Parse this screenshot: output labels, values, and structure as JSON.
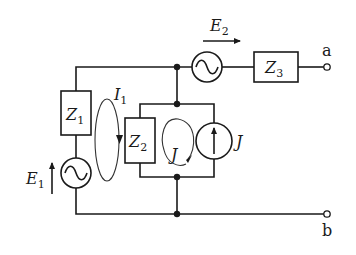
{
  "diagram": {
    "type": "electrical-circuit",
    "components": {
      "Z1": {
        "label": "Z",
        "sub": "1",
        "kind": "impedance"
      },
      "Z2": {
        "label": "Z",
        "sub": "2",
        "kind": "impedance"
      },
      "Z3": {
        "label": "Z",
        "sub": "3",
        "kind": "impedance"
      },
      "E1": {
        "label": "E",
        "sub": "1",
        "kind": "ac-voltage-source",
        "arrow": "up"
      },
      "E2": {
        "label": "E",
        "sub": "2",
        "kind": "ac-voltage-source",
        "arrow": "right"
      },
      "J": {
        "label": "J",
        "kind": "current-source",
        "arrow": "up"
      }
    },
    "loops": {
      "I1": {
        "label": "I",
        "sub": "1",
        "direction": "clockwise"
      },
      "J": {
        "label": "J",
        "direction": "counter-clockwise"
      }
    },
    "terminals": {
      "a": "a",
      "b": "b"
    }
  },
  "colors": {
    "ink": "#1a1a1a",
    "background": "#ffffff"
  }
}
